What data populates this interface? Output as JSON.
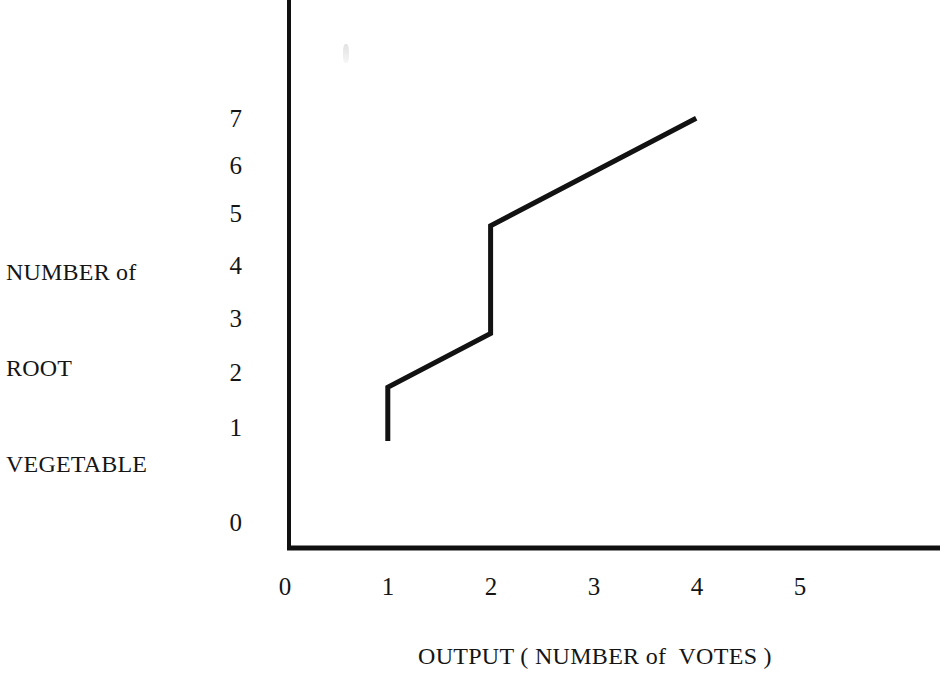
{
  "chart_data": {
    "type": "line",
    "title": "",
    "subtitle": "",
    "xlabel": "OUTPUT ( NUMBER of  VOTES )",
    "ylabel": "NUMBER of\nROOT\nVEGETABLE",
    "ylabel_lines": [
      "NUMBER of",
      "ROOT",
      "VEGETABLE"
    ],
    "x_tick_labels": [
      "0",
      "1",
      "2",
      "3",
      "4",
      "5"
    ],
    "y_tick_labels": [
      "0",
      "1",
      "2",
      "3",
      "4",
      "5",
      "6",
      "7"
    ],
    "xlim": [
      0,
      6.3
    ],
    "ylim": [
      0,
      7.6
    ],
    "grid": false,
    "legend": null,
    "series": [
      {
        "name": "root vegetable output",
        "line_color": "#121212",
        "line_width": 5,
        "points": [
          {
            "x": 1,
            "y": 1
          },
          {
            "x": 1,
            "y": 2
          },
          {
            "x": 2,
            "y": 3
          },
          {
            "x": 2,
            "y": 5
          },
          {
            "x": 4,
            "y": 7
          }
        ]
      }
    ]
  },
  "axes": {
    "y_caption_lines": [
      "NUMBER of",
      "ROOT",
      "VEGETABLE"
    ],
    "x_caption": "OUTPUT ( NUMBER of  VOTES )",
    "y_ticks": [
      {
        "label": "7"
      },
      {
        "label": "6"
      },
      {
        "label": "5"
      },
      {
        "label": "4"
      },
      {
        "label": "3"
      },
      {
        "label": "2"
      },
      {
        "label": "1"
      },
      {
        "label": "0"
      }
    ],
    "x_ticks": [
      {
        "label": "0"
      },
      {
        "label": "1"
      },
      {
        "label": "2"
      },
      {
        "label": "3"
      },
      {
        "label": "4"
      },
      {
        "label": "5"
      }
    ],
    "axis_color": "#101010"
  }
}
